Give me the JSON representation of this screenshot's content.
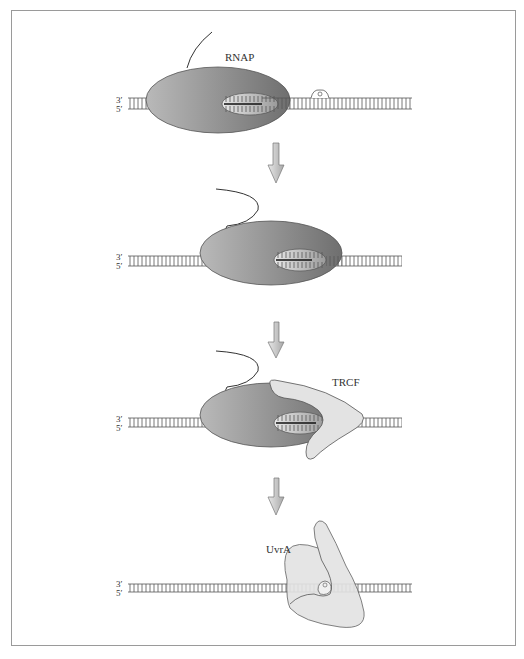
{
  "figure": {
    "panels": [
      {
        "id": "panel-1",
        "strand_labels": {
          "top": "3′",
          "bottom": "5′"
        },
        "protein_label": "RNAP"
      },
      {
        "id": "panel-2",
        "strand_labels": {
          "top": "3′",
          "bottom": "5′"
        }
      },
      {
        "id": "panel-3",
        "strand_labels": {
          "top": "3′",
          "bottom": "5′"
        },
        "protein_label": "TRCF"
      },
      {
        "id": "panel-4",
        "strand_labels": {
          "top": "3′",
          "bottom": "5′"
        },
        "protein_label": "UvrA"
      }
    ],
    "colors": {
      "rnap_dark": "#6f6f6f",
      "rnap_light": "#b9b9b9",
      "trcf_fill": "#e3e3e3",
      "uvra_fill": "#e3e3e3",
      "dna_line": "#555555",
      "arrow_fill": "#cfcfcf",
      "border": "#9a9a9a"
    }
  }
}
